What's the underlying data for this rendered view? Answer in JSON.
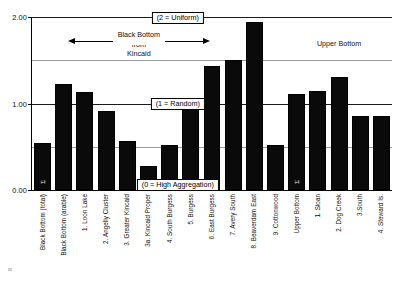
{
  "chart_data": {
    "type": "bar",
    "title": "",
    "xlabel": "",
    "ylabel": "",
    "ylim": [
      0.0,
      2.0
    ],
    "yticks": [
      "0.00",
      "1.00",
      "2.00"
    ],
    "ytick_values": [
      0.0,
      1.0,
      2.0
    ],
    "gridlines": [
      0.5,
      1.0,
      1.5,
      2.0
    ],
    "grid": true,
    "legend": "none",
    "categories": [
      "Black Bottom (total)",
      "Black Bottom (arable)",
      "1. Loon Lake",
      "2. Angelly Cluster",
      "3. Greater Kincaid",
      "3a. Kincaid Proper",
      "4. South Burgess",
      "5. Burgess",
      "6. East Burgess",
      "7. Avery South",
      "8. Beaverdam East",
      "9. Cottonwood",
      "Upper Bottom",
      "1. Sloan",
      "2. Dog Creek",
      "3.South",
      "4. Steward Is."
    ],
    "values": [
      0.54,
      1.22,
      1.13,
      0.91,
      0.57,
      0.28,
      0.52,
      1.0,
      1.43,
      1.5,
      1.94,
      0.52,
      1.11,
      1.14,
      1.31,
      0.86,
      0.85
    ],
    "bar_color": "#0a0a0a",
    "summary_bar_indices": [
      0,
      12
    ],
    "summary_bar_marker": "Σ",
    "annotations": [
      {
        "name": "uniform-note",
        "text": "(2 = Uniform)",
        "boxed": true,
        "at_value": 2.0
      },
      {
        "name": "random-note",
        "text": "(1 = Random)",
        "boxed": true,
        "at_value": 1.0
      },
      {
        "name": "high-aggregation-note",
        "text": "(0 = High Aggregation)",
        "boxed": true,
        "at_value": 0.0
      },
      {
        "name": "black-bottom-group",
        "text": "Black Bottom\nfrom\nKincaid",
        "boxed": false
      },
      {
        "name": "upper-bottom-group",
        "text": "Upper Bottom",
        "boxed": false
      }
    ],
    "group_labels": {
      "left_group_line1": "Black Bottom",
      "left_group_line2": "from",
      "left_group_line3": "Kincaid",
      "right_group": "Upper Bottom"
    },
    "axis_color": "#000000",
    "grid_color": "#9a9a9a"
  }
}
